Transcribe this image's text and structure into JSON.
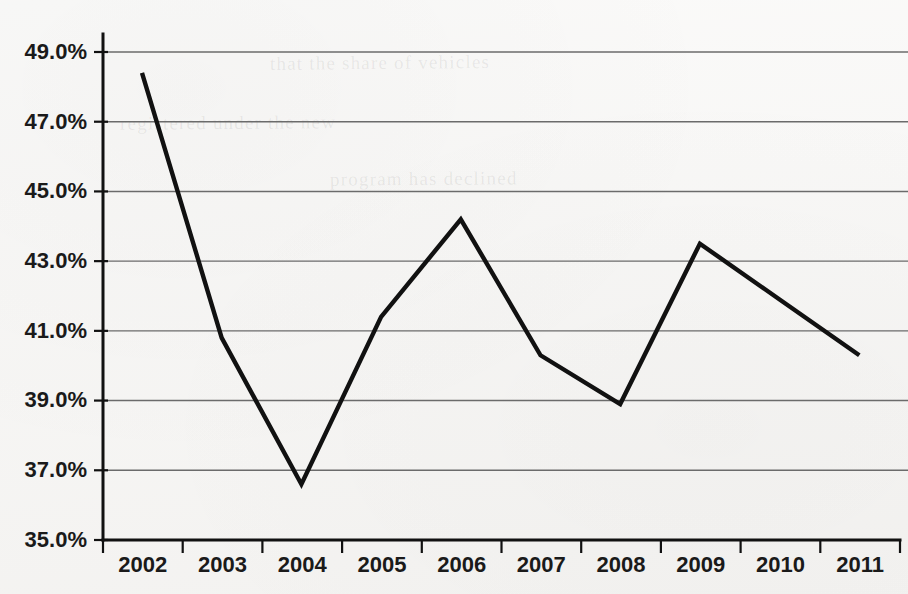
{
  "chart_data": {
    "type": "line",
    "title": "",
    "subtitle": "",
    "xlabel": "",
    "ylabel": "",
    "categories": [
      "2002",
      "2003",
      "2004",
      "2005",
      "2006",
      "2007",
      "2008",
      "2009",
      "2010",
      "2011"
    ],
    "x": [
      2002,
      2003,
      2004,
      2005,
      2006,
      2007,
      2008,
      2009,
      2010,
      2011
    ],
    "values": [
      48.4,
      40.8,
      36.6,
      41.4,
      44.2,
      40.3,
      38.9,
      43.5,
      41.9,
      40.3
    ],
    "series": [
      {
        "name": "",
        "values": [
          48.4,
          40.8,
          36.6,
          41.4,
          44.2,
          40.3,
          38.9,
          43.5,
          41.9,
          40.3
        ]
      }
    ],
    "ylim": [
      35.0,
      49.0
    ],
    "ytick_values": [
      35.0,
      37.0,
      39.0,
      41.0,
      43.0,
      45.0,
      47.0,
      49.0
    ],
    "ytick_labels": [
      "35.0%",
      "37.0%",
      "39.0%",
      "41.0%",
      "43.0%",
      "45.0%",
      "47.0%",
      "49.0%"
    ],
    "xtick_labels": [
      "2002",
      "2003",
      "2004",
      "2005",
      "2006",
      "2007",
      "2008",
      "2009",
      "2010",
      "2011"
    ],
    "grid": true,
    "grid_axis": "y",
    "legend": false,
    "legend_position": "none",
    "line_color": "#111111",
    "grid_color": "#6b6b6b",
    "axis_color": "#111111",
    "background_color": "#f6f5f3",
    "markers": false,
    "annotations": []
  },
  "axes": {
    "y_axis_name": "y-axis",
    "x_axis_name": "x-axis"
  },
  "bleed_text": {
    "line1": "that the share of vehicles",
    "line2": "registered under the new",
    "line3": "program has declined"
  }
}
